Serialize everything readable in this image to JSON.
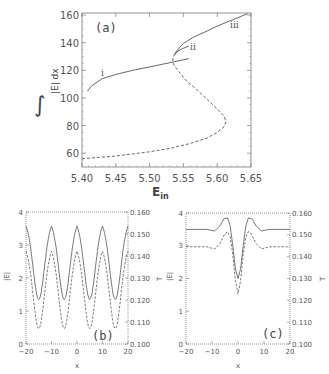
{
  "chart_data": [
    {
      "panel": "a",
      "type": "line",
      "title": "",
      "panel_label": "(a)",
      "xlabel": "E_in",
      "xlabel_main": "E",
      "xlabel_sub": "in",
      "ylabel": "∫|E| dx",
      "xlim": [
        5.4,
        5.65
      ],
      "ylim": [
        50,
        161.5
      ],
      "xticks": [
        "5.40",
        "5.45",
        "5.50",
        "5.55",
        "5.60",
        "5.65"
      ],
      "yticks": [
        "60",
        "80",
        "100",
        "120",
        "140",
        "160"
      ],
      "grid": false,
      "series": [
        {
          "name": "i",
          "style": "solid",
          "label": "i",
          "x": [
            5.408,
            5.415,
            5.43,
            5.45,
            5.475,
            5.5,
            5.52,
            5.535,
            5.558
          ],
          "y": [
            105,
            109,
            114,
            117,
            120,
            122.5,
            124.5,
            126,
            128.5
          ]
        },
        {
          "name": "unstable",
          "style": "dashed",
          "label": "",
          "x": [
            5.4,
            5.45,
            5.5,
            5.53,
            5.56,
            5.585,
            5.6,
            5.61,
            5.613,
            5.61,
            5.6,
            5.585,
            5.57,
            5.555,
            5.545,
            5.537,
            5.534,
            5.535
          ],
          "y": [
            56,
            58,
            61,
            63.5,
            67,
            71,
            75,
            79,
            83,
            87,
            92,
            99,
            106,
            112,
            118,
            123,
            126,
            130
          ]
        },
        {
          "name": "iii",
          "style": "solid",
          "label": "iii",
          "x": [
            5.535,
            5.54,
            5.55,
            5.565,
            5.585,
            5.6,
            5.62,
            5.645
          ],
          "y": [
            130,
            134,
            139.5,
            144,
            148.5,
            152,
            156,
            161
          ]
        },
        {
          "name": "ii",
          "style": "solid",
          "label": "ii",
          "x": [
            5.537,
            5.542,
            5.55,
            5.558
          ],
          "y": [
            131,
            134,
            136,
            137.5
          ]
        }
      ],
      "annotations": [
        {
          "text": "i",
          "x": 5.44,
          "y": 120
        },
        {
          "text": "ii",
          "x": 5.566,
          "y": 135
        },
        {
          "text": "iii",
          "x": 5.625,
          "y": 156
        }
      ]
    },
    {
      "panel": "b",
      "type": "line",
      "panel_label": "(b)",
      "xlabel": "x",
      "ylabel": "|E|",
      "ylabel_right": "T",
      "xlim": [
        -20,
        20
      ],
      "ylim": [
        0,
        4
      ],
      "ylim_right": [
        0.1,
        0.16
      ],
      "xticks": [
        "−20",
        "−10",
        "0",
        "10",
        "20"
      ],
      "yticks": [
        "0",
        "1",
        "2",
        "3",
        "4"
      ],
      "yticks_right": [
        "0.100",
        "0.110",
        "0.120",
        "0.130",
        "0.140",
        "0.150",
        "0.160"
      ],
      "series": [
        {
          "name": "|E|",
          "style": "solid",
          "axis": "left",
          "period": 10,
          "max": 3.75,
          "min": 1.35,
          "min_at": [
            -15,
            -5,
            5,
            15
          ]
        },
        {
          "name": "T",
          "style": "dashed",
          "axis": "right",
          "period": 10,
          "max": 0.145,
          "min": 0.107,
          "min_at": [
            -15,
            -5,
            5,
            15
          ]
        }
      ]
    },
    {
      "panel": "c",
      "type": "line",
      "panel_label": "(c)",
      "xlabel": "x",
      "ylabel": "|E|",
      "ylabel_right": "T",
      "xlim": [
        -20,
        20
      ],
      "ylim": [
        0,
        4
      ],
      "ylim_right": [
        0.1,
        0.16
      ],
      "xticks": [
        "−20",
        "−10",
        "0",
        "10",
        "20"
      ],
      "yticks": [
        "0",
        "1",
        "2",
        "3",
        "4"
      ],
      "yticks_right": [
        "0.100",
        "0.110",
        "0.120",
        "0.130",
        "0.140",
        "0.150",
        "0.160"
      ],
      "series": [
        {
          "name": "|E|",
          "style": "solid",
          "axis": "left",
          "x": [
            -20,
            -12,
            -9,
            -7,
            -5.5,
            -4,
            -3,
            -2,
            -1,
            0,
            1,
            2,
            3,
            4,
            5.5,
            7,
            9,
            12,
            20
          ],
          "y": [
            3.5,
            3.5,
            3.45,
            3.6,
            3.82,
            3.85,
            3.6,
            3.0,
            2.3,
            2.0,
            2.3,
            3.0,
            3.6,
            3.85,
            3.82,
            3.6,
            3.45,
            3.5,
            3.5
          ]
        },
        {
          "name": "T",
          "style": "dashed",
          "axis": "right",
          "x": [
            -20,
            -12,
            -9,
            -7,
            -5,
            -4,
            -3,
            -2,
            -1,
            0,
            1,
            2,
            3,
            4,
            5,
            7,
            9,
            12,
            20
          ],
          "y": [
            0.1445,
            0.1445,
            0.1435,
            0.146,
            0.1505,
            0.1515,
            0.149,
            0.141,
            0.129,
            0.123,
            0.129,
            0.141,
            0.149,
            0.1515,
            0.1505,
            0.146,
            0.1435,
            0.1445,
            0.1445
          ]
        }
      ]
    }
  ],
  "labels": {
    "a_panel": "(a)",
    "b_panel": "(b)",
    "c_panel": "(c)",
    "a_ylabel_text": "|E| dx",
    "a_ylabel_integral": "∫",
    "a_xlabel_main": "E",
    "a_xlabel_sub": "in",
    "curve_i": "i",
    "curve_ii": "ii",
    "curve_iii": "iii",
    "bc_ylabel": "|E|",
    "bc_ylabel_right": "T",
    "bc_xlabel": "x"
  }
}
